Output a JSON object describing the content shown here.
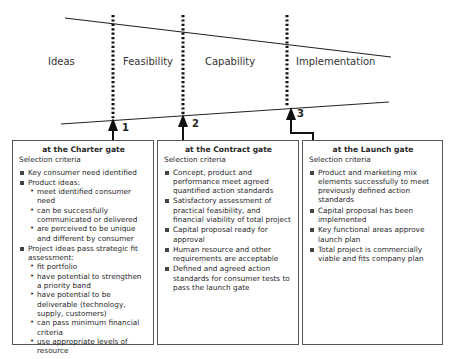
{
  "stages": [
    {
      "label": "Ideas",
      "x": 48
    },
    {
      "label": "Feasibility",
      "x": 123
    },
    {
      "label": "Capability",
      "x": 205
    },
    {
      "label": "Implementation",
      "x": 296
    }
  ],
  "gates": [
    {
      "number": "1",
      "x": 113
    },
    {
      "number": "2",
      "x": 183
    },
    {
      "number": "3",
      "x": 287
    }
  ],
  "boxes": [
    {
      "title": "at the Charter gate",
      "subtitle": "Selection criteria",
      "criteria": [
        {
          "text": "Key consumer need identified",
          "sub": []
        },
        {
          "text": "Product ideas:",
          "sub": [
            "meet identified consumer need",
            "can be successfully communicated or delivered",
            "are perceived to be unique and different by consumer"
          ]
        },
        {
          "text": "Project ideas pass strategic fit assessment:",
          "sub": [
            "fit portfolio",
            "have potential to strengthen a priority band",
            "have potential to be deliverable (technology, supply, customers)",
            "can pass minimum financial criteria",
            "use appropriate levels of resource"
          ]
        }
      ]
    },
    {
      "title": "at the Contract gate",
      "subtitle": "Selection criteria",
      "criteria": [
        {
          "text": "Concept, product and performance meet agreed quantified action standards",
          "sub": []
        },
        {
          "text": "Satisfactory assessment of practical feasibility, and financial viability of total project",
          "sub": []
        },
        {
          "text": "Capital proposal ready for approval",
          "sub": []
        },
        {
          "text": "Human resource and other requirements are acceptable",
          "sub": []
        },
        {
          "text": "Defined and agreed action standards for consumer tests to pass the launch gate",
          "sub": []
        }
      ]
    },
    {
      "title": "at the Launch gate",
      "subtitle": "Selection criteria",
      "criteria": [
        {
          "text": "Product and marketing mix elements successfully to meet previously defined action standards",
          "sub": []
        },
        {
          "text": "Capital proposal has been implemented",
          "sub": []
        },
        {
          "text": "Key functional areas approve launch plan",
          "sub": []
        },
        {
          "text": "Total project is commercially viable and fits company plan",
          "sub": []
        }
      ]
    }
  ]
}
